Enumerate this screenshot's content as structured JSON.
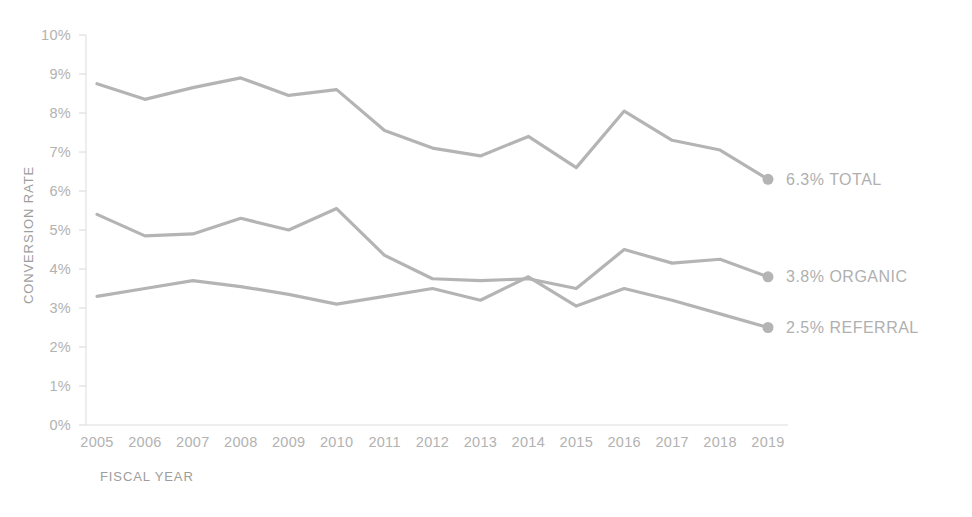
{
  "chart_data": {
    "type": "line",
    "title": "",
    "xlabel": "FISCAL YEAR",
    "ylabel": "CONVERSION RATE",
    "categories": [
      "2005",
      "2006",
      "2007",
      "2008",
      "2009",
      "2010",
      "2011",
      "2012",
      "2013",
      "2014",
      "2015",
      "2016",
      "2017",
      "2018",
      "2019"
    ],
    "ylim": [
      0,
      10
    ],
    "ytick_labels": [
      "0%",
      "1%",
      "2%",
      "3%",
      "4%",
      "5%",
      "6%",
      "7%",
      "8%",
      "9%",
      "10%"
    ],
    "ytick_values": [
      0,
      1,
      2,
      3,
      4,
      5,
      6,
      7,
      8,
      9,
      10
    ],
    "grid": false,
    "legend_position": "right-end-labels",
    "series": [
      {
        "name": "TOTAL",
        "end_label": "6.3% TOTAL",
        "end_value": "6.3%",
        "color": "#b4b4b4",
        "values": [
          8.75,
          8.35,
          8.65,
          8.9,
          8.45,
          8.6,
          7.55,
          7.1,
          6.9,
          7.4,
          6.6,
          8.05,
          7.3,
          7.05,
          6.3
        ]
      },
      {
        "name": "ORGANIC",
        "end_label": "3.8% ORGANIC",
        "end_value": "3.8%",
        "color": "#b4b4b4",
        "values": [
          5.4,
          4.85,
          4.9,
          5.3,
          5.0,
          5.55,
          4.35,
          3.75,
          3.7,
          3.75,
          3.5,
          4.5,
          4.15,
          4.25,
          3.8
        ]
      },
      {
        "name": "REFERRAL",
        "end_label": "2.5% REFERRAL",
        "end_value": "2.5%",
        "color": "#b4b4b4",
        "values": [
          3.3,
          3.5,
          3.7,
          3.55,
          3.35,
          3.1,
          3.3,
          3.5,
          3.2,
          3.8,
          3.05,
          3.5,
          3.2,
          2.85,
          2.5
        ]
      }
    ],
    "colors": {
      "line": "#b4b4b4",
      "tick_text": "#b2b2b2",
      "axis_title": "#9d9d9d",
      "series_label": "#b0b0b0",
      "axis": "#dcdcdc",
      "background": "#ffffff"
    }
  }
}
